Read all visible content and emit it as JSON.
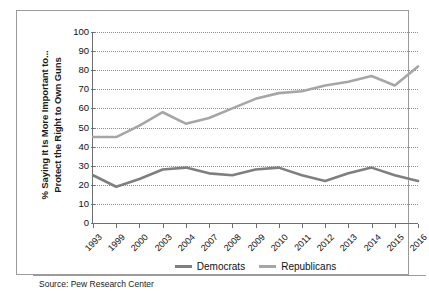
{
  "chart_data": {
    "type": "line",
    "title": "",
    "subtitle": "",
    "xlabel": "",
    "ylabel": "% Saying It Is More Important to... Protect the Right to Own Guns",
    "ylabel_lines": [
      "% Saying It Is More Important to...",
      "Protect the Right to Own Guns"
    ],
    "categories": [
      "1993",
      "1999",
      "2000",
      "2003",
      "2004",
      "2007",
      "2008",
      "2009",
      "2010",
      "2011",
      "2012",
      "2013",
      "2014",
      "2015",
      "2016"
    ],
    "ylim": [
      0,
      100
    ],
    "yticks": [
      0,
      10,
      20,
      30,
      40,
      50,
      60,
      70,
      80,
      90,
      100
    ],
    "grid": true,
    "legend_position": "bottom",
    "series": [
      {
        "name": "Democrats",
        "color": "#7f7f7f",
        "values": [
          25,
          19,
          23,
          28,
          29,
          26,
          25,
          28,
          29,
          25,
          22,
          26,
          29,
          25,
          22
        ]
      },
      {
        "name": "Republicans",
        "color": "#a6a6a6",
        "values": [
          45,
          45,
          51,
          58,
          52,
          55,
          60,
          65,
          68,
          69,
          72,
          74,
          77,
          72,
          82
        ]
      }
    ],
    "source": "Source: Pew Research Center"
  },
  "colors": {
    "frame": "#9b9b9b",
    "axis": "#6e6e6e",
    "grid": "#8d8d8d",
    "text": "#111111",
    "background": "#ffffff"
  }
}
